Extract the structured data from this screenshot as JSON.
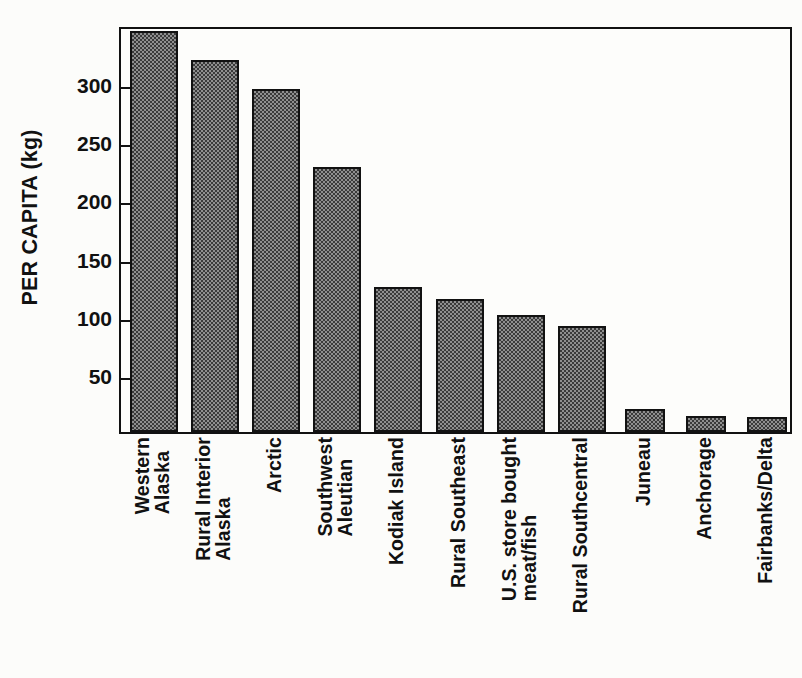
{
  "chart_data": {
    "type": "bar",
    "title": "",
    "xlabel": "",
    "ylabel": "PER CAPITA (kg)",
    "ylim": [
      0,
      350
    ],
    "grid": false,
    "legend": "none",
    "ytick_labels": [
      "50",
      "100",
      "150",
      "200",
      "250",
      "300"
    ],
    "ytick_values": [
      50,
      100,
      150,
      200,
      250,
      300
    ],
    "categories": [
      "Western Alaska",
      "Rural Interior Alaska",
      "Arctic",
      "Southwest Aleutian",
      "Kodiak Island",
      "Rural Southeast",
      "U.S. store bought meat/fish",
      "Rural Southcentral",
      "Juneau",
      "Anchorage",
      "Fairbanks/Delta"
    ],
    "values": [
      345,
      320,
      295,
      228,
      125,
      114,
      101,
      91,
      20,
      14,
      13
    ],
    "bars": [
      {
        "label_line1": "Western",
        "label_line2": "Alaska",
        "value": 345
      },
      {
        "label_line1": "Rural Interior",
        "label_line2": "Alaska",
        "value": 320
      },
      {
        "label_line1": "Arctic",
        "label_line2": "",
        "value": 295
      },
      {
        "label_line1": "Southwest",
        "label_line2": "Aleutian",
        "value": 228
      },
      {
        "label_line1": "Kodiak Island",
        "label_line2": "",
        "value": 125
      },
      {
        "label_line1": "Rural Southeast",
        "label_line2": "",
        "value": 114
      },
      {
        "label_line1": "U.S. store bought",
        "label_line2": "meat/fish",
        "value": 101
      },
      {
        "label_line1": "Rural Southcentral",
        "label_line2": "",
        "value": 91
      },
      {
        "label_line1": "Juneau",
        "label_line2": "",
        "value": 20
      },
      {
        "label_line1": "Anchorage",
        "label_line2": "",
        "value": 14
      },
      {
        "label_line1": "Fairbanks/Delta",
        "label_line2": "",
        "value": 13
      }
    ],
    "bar_fill_color": "#8f8f8f",
    "bar_edge_color": "#121212",
    "axis_color": "#111111",
    "background_color": "#fdfdfb"
  }
}
